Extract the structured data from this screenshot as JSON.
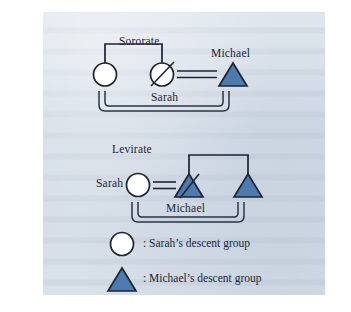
{
  "figure": {
    "panel_background": "#cfd9e4",
    "ink_color": "#1c2436",
    "symbol_colors": {
      "female_fill": "#ffffff",
      "female_stroke": "#1c2436",
      "male_fill": "#4e7bae",
      "male_stroke": "#1c2436"
    }
  },
  "sororate": {
    "title": "Sororate",
    "labels": {
      "deceased_wife": "Sarah",
      "husband": "Michael"
    },
    "nodes": [
      {
        "id": "sister",
        "symbol": "circle",
        "sex": "female",
        "status": "living",
        "label": ""
      },
      {
        "id": "sarah",
        "symbol": "circle",
        "sex": "female",
        "status": "deceased",
        "label": "Sarah"
      },
      {
        "id": "michael",
        "symbol": "triangle",
        "sex": "male",
        "status": "living",
        "label": "Michael"
      }
    ],
    "links": [
      {
        "type": "sibling",
        "from": "sister",
        "to": "sarah"
      },
      {
        "type": "marriage",
        "from": "sarah",
        "to": "michael"
      },
      {
        "type": "descent-bracket",
        "from": "sister",
        "to": "michael"
      }
    ]
  },
  "levirate": {
    "title": "Levirate",
    "labels": {
      "wife": "Sarah",
      "deceased_husband": "Michael"
    },
    "nodes": [
      {
        "id": "sarah",
        "symbol": "circle",
        "sex": "female",
        "status": "living",
        "label": "Sarah"
      },
      {
        "id": "michael",
        "symbol": "triangle",
        "sex": "male",
        "status": "deceased",
        "label": "Michael"
      },
      {
        "id": "brother",
        "symbol": "triangle",
        "sex": "male",
        "status": "living",
        "label": ""
      }
    ],
    "links": [
      {
        "type": "marriage",
        "from": "sarah",
        "to": "michael"
      },
      {
        "type": "sibling",
        "from": "michael",
        "to": "brother"
      },
      {
        "type": "descent-bracket",
        "from": "sarah",
        "to": "brother"
      }
    ]
  },
  "legend": {
    "items": [
      {
        "symbol": "circle",
        "text": ": Sarah’s descent group"
      },
      {
        "symbol": "triangle",
        "text": ": Michael’s descent group"
      }
    ]
  }
}
